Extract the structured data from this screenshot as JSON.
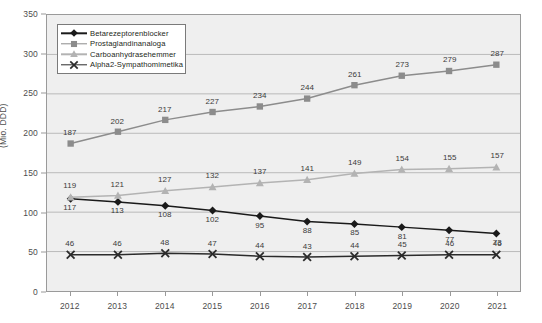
{
  "chart_data": {
    "type": "line",
    "title": "",
    "xlabel": "",
    "ylabel": "(Mio. DDD)",
    "categories": [
      "2012",
      "2013",
      "2014",
      "2015",
      "2016",
      "2017",
      "2018",
      "2019",
      "2020",
      "2021"
    ],
    "ylim": [
      0,
      350
    ],
    "yticks": [
      0,
      50,
      100,
      150,
      200,
      250,
      300,
      350
    ],
    "grid": true,
    "legend_position": "top-left",
    "series": [
      {
        "name": "Betarezeptorenblocker",
        "color": "#1a1a1a",
        "marker": "diamond",
        "values": [
          117,
          113,
          108,
          102,
          95,
          88,
          85,
          81,
          77,
          73
        ]
      },
      {
        "name": "Prostaglandinanaloga",
        "color": "#8c8c8c",
        "marker": "square",
        "values": [
          187,
          202,
          217,
          227,
          234,
          244,
          261,
          273,
          279,
          287
        ]
      },
      {
        "name": "Carboanhydrasehemmer",
        "color": "#b3b3b3",
        "marker": "triangle",
        "values": [
          119,
          121,
          127,
          132,
          137,
          141,
          149,
          154,
          155,
          157
        ]
      },
      {
        "name": "Alpha2-Sympathomimetika",
        "color": "#2b2b2b",
        "marker": "cross",
        "values": [
          46,
          46,
          48,
          47,
          44,
          43,
          44,
          45,
          46,
          46
        ]
      }
    ]
  },
  "style": {
    "plot_background": "#efefef",
    "page_background": "#ffffff",
    "grid_color": "#b9b9b9",
    "axis_color": "#9a9a9a",
    "tick_text_color": "#4d4d4d",
    "label_text_color": "#3b3b3b"
  }
}
